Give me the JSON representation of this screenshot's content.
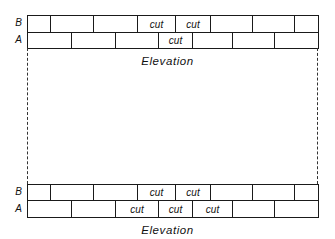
{
  "diagram": {
    "type": "brick-course-elevation",
    "top_elevation": {
      "caption": "Elevation",
      "row_labels": {
        "B": "B",
        "A": "A"
      },
      "course_B": [
        {
          "x0": 27,
          "x1": 50,
          "label": ""
        },
        {
          "x0": 50,
          "x1": 93,
          "label": ""
        },
        {
          "x0": 93,
          "x1": 137,
          "label": ""
        },
        {
          "x0": 137,
          "x1": 175,
          "label": "cut"
        },
        {
          "x0": 175,
          "x1": 210,
          "label": "cut"
        },
        {
          "x0": 210,
          "x1": 252,
          "label": ""
        },
        {
          "x0": 252,
          "x1": 294,
          "label": ""
        },
        {
          "x0": 294,
          "x1": 318,
          "label": ""
        }
      ],
      "course_A": [
        {
          "x0": 27,
          "x1": 71,
          "label": ""
        },
        {
          "x0": 71,
          "x1": 115,
          "label": ""
        },
        {
          "x0": 115,
          "x1": 158,
          "label": ""
        },
        {
          "x0": 158,
          "x1": 192,
          "label": "cut"
        },
        {
          "x0": 192,
          "x1": 232,
          "label": ""
        },
        {
          "x0": 232,
          "x1": 274,
          "label": ""
        },
        {
          "x0": 274,
          "x1": 318,
          "label": ""
        }
      ]
    },
    "bottom_elevation": {
      "caption": "Elevation",
      "row_labels": {
        "B": "B",
        "A": "A"
      },
      "course_B": [
        {
          "x0": 27,
          "x1": 50,
          "label": ""
        },
        {
          "x0": 50,
          "x1": 93,
          "label": ""
        },
        {
          "x0": 93,
          "x1": 137,
          "label": ""
        },
        {
          "x0": 137,
          "x1": 175,
          "label": "cut"
        },
        {
          "x0": 175,
          "x1": 210,
          "label": "cut"
        },
        {
          "x0": 210,
          "x1": 252,
          "label": ""
        },
        {
          "x0": 252,
          "x1": 294,
          "label": ""
        },
        {
          "x0": 294,
          "x1": 318,
          "label": ""
        }
      ],
      "course_A": [
        {
          "x0": 27,
          "x1": 71,
          "label": ""
        },
        {
          "x0": 71,
          "x1": 115,
          "label": ""
        },
        {
          "x0": 115,
          "x1": 158,
          "label": "cut"
        },
        {
          "x0": 158,
          "x1": 192,
          "label": "cut"
        },
        {
          "x0": 192,
          "x1": 232,
          "label": "cut"
        },
        {
          "x0": 232,
          "x1": 274,
          "label": ""
        },
        {
          "x0": 274,
          "x1": 318,
          "label": ""
        }
      ]
    }
  }
}
